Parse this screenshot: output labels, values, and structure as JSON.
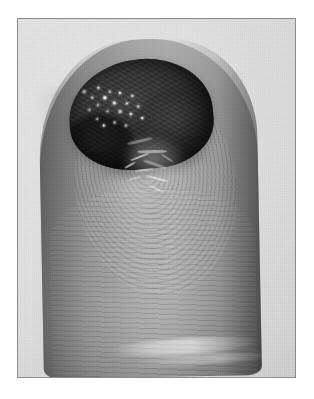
{
  "document": {
    "kind": "clinical-photograph",
    "title": "Clinical photograph of fingertip lesion",
    "caption": "",
    "color_mode": "grayscale",
    "orientation": "portrait",
    "width_px": 314,
    "height_px": 399
  },
  "frame": {
    "border_color": "#8c8c8c",
    "border_width_px": 1,
    "page_background": "#ffffff",
    "photo_background": "#d6d6d6",
    "left_px": 17,
    "top_px": 18,
    "width_px": 279,
    "height_px": 360
  },
  "palette": {
    "page_white": "#ffffff",
    "frame_line": "#8c8c8c",
    "backdrop_light": "#dcdcdc",
    "backdrop_mid": "#d6d6d6",
    "backdrop_dark": "#cacaca",
    "skin_highlight": "#a8a8a8",
    "skin_mid": "#939393",
    "skin_shadow": "#6d6d6d",
    "lesion_mid": "#3d3d3d",
    "lesion_dark": "#1f1f1f",
    "specular_white": "#f3f3f3"
  },
  "subject": {
    "name": "fingertip",
    "description": "Distal phalanx of a finger photographed against a plain light-gray backdrop, volar surface toward the viewer with fingerprint ridge detail visible.",
    "features": [
      {
        "name": "lesion",
        "label": "Dark crusted nodular lesion",
        "location": "distal tip, extending over the nail fold",
        "appearance": "Dark, irregular, lobulated mass with a crusted surface and multiple bright specular highlights",
        "approx_bounds_px": {
          "x": 56,
          "y": 40,
          "width": 144,
          "height": 110
        }
      },
      {
        "name": "moist-band",
        "label": "Glistening moist surface",
        "location": "immediately distal-to-proximal of the lesion margin",
        "appearance": "Bright irregular streaks suggesting a wet or exudative surface"
      },
      {
        "name": "fingerprint-ridges",
        "label": "Fingerprint ridge pattern",
        "location": "volar pulp of the fingertip",
        "appearance": "Concentric whorl transitioning to transverse arches toward the base"
      },
      {
        "name": "distal-crease",
        "label": "Interphalangeal skin crease",
        "location": "lower third of the visible finger",
        "appearance": "Pale transverse highlight across the pulp"
      }
    ]
  },
  "specular_highlights": [
    {
      "x": 16,
      "y": 26,
      "size": 3
    },
    {
      "x": 24,
      "y": 33,
      "size": 2
    },
    {
      "x": 31,
      "y": 24,
      "size": 2
    },
    {
      "x": 36,
      "y": 34,
      "size": 3
    },
    {
      "x": 29,
      "y": 41,
      "size": 2
    },
    {
      "x": 42,
      "y": 29,
      "size": 2
    },
    {
      "x": 45,
      "y": 40,
      "size": 3
    },
    {
      "x": 52,
      "y": 31,
      "size": 2
    },
    {
      "x": 38,
      "y": 48,
      "size": 2
    },
    {
      "x": 50,
      "y": 49,
      "size": 3
    },
    {
      "x": 58,
      "y": 42,
      "size": 2
    },
    {
      "x": 61,
      "y": 53,
      "size": 2
    },
    {
      "x": 27,
      "y": 55,
      "size": 2
    },
    {
      "x": 44,
      "y": 60,
      "size": 2
    },
    {
      "x": 69,
      "y": 46,
      "size": 2
    },
    {
      "x": 72,
      "y": 58,
      "size": 2
    },
    {
      "x": 20,
      "y": 45,
      "size": 2
    },
    {
      "x": 55,
      "y": 64,
      "size": 2
    },
    {
      "x": 64,
      "y": 35,
      "size": 2
    },
    {
      "x": 33,
      "y": 62,
      "size": 2
    }
  ],
  "moist_streaks": [
    {
      "x": 10,
      "y": 18,
      "width": 26,
      "height": 3,
      "rotate": -24
    },
    {
      "x": 22,
      "y": 26,
      "width": 30,
      "height": 3,
      "rotate": -12
    },
    {
      "x": 16,
      "y": 34,
      "width": 20,
      "height": 2,
      "rotate": -32
    },
    {
      "x": 30,
      "y": 38,
      "width": 24,
      "height": 3,
      "rotate": 8
    },
    {
      "x": 24,
      "y": 46,
      "width": 18,
      "height": 2,
      "rotate": -18
    },
    {
      "x": 36,
      "y": 52,
      "width": 22,
      "height": 2,
      "rotate": 4
    },
    {
      "x": 18,
      "y": 56,
      "width": 14,
      "height": 2,
      "rotate": -28
    },
    {
      "x": 40,
      "y": 62,
      "width": 16,
      "height": 2,
      "rotate": 14
    },
    {
      "x": 12,
      "y": 44,
      "width": 12,
      "height": 2,
      "rotate": -40
    },
    {
      "x": 46,
      "y": 30,
      "width": 14,
      "height": 2,
      "rotate": 22
    }
  ]
}
